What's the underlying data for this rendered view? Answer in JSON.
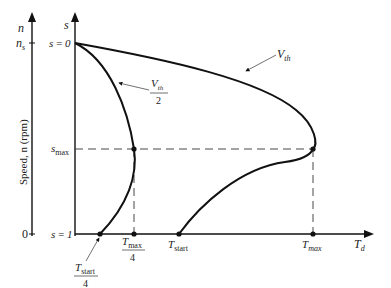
{
  "diagram": {
    "left_axis": {
      "symbol": "n",
      "top_tick": "n",
      "top_tick_sub": "s",
      "bottom_tick": "0",
      "label": "Speed, n  (rpm)"
    },
    "slip_axis": {
      "symbol": "s",
      "ticks": [
        {
          "label": "s = 0",
          "text": "s = 0"
        },
        {
          "label": "s_max",
          "base": "s",
          "sub": "max"
        },
        {
          "label": "s = 1",
          "text": "s = 1"
        }
      ]
    },
    "torque_axis": {
      "symbol": "T",
      "symbol_sub": "d",
      "ticks": [
        {
          "id": "tstart4",
          "num": "T",
          "num_sub": "start",
          "den": "4"
        },
        {
          "id": "tmax4",
          "num": "T",
          "num_sub": "max",
          "den": "4"
        },
        {
          "id": "tstart",
          "base": "T",
          "sub": "start"
        },
        {
          "id": "tmax",
          "base": "T",
          "sub": "max"
        }
      ]
    },
    "curves": [
      {
        "name": "full-voltage",
        "label": "V",
        "label_sub": "th"
      },
      {
        "name": "half-voltage",
        "label": "V",
        "label_sub": "th",
        "label_den": "2"
      }
    ],
    "line_color": "#111111",
    "background": "#ffffff"
  }
}
